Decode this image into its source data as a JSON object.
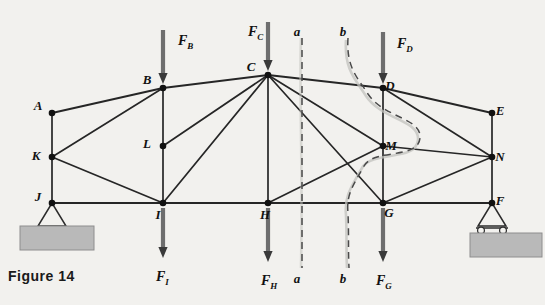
{
  "figure": {
    "caption": "Figure 14"
  },
  "nodes": [
    {
      "id": "A",
      "label": "A",
      "x": 52,
      "y": 113,
      "label_dx": -14,
      "label_dy": -3
    },
    {
      "id": "B",
      "label": "B",
      "x": 163,
      "y": 88,
      "label_dx": -16,
      "label_dy": -4
    },
    {
      "id": "C",
      "label": "C",
      "x": 268,
      "y": 75,
      "label_dx": -17,
      "label_dy": -4
    },
    {
      "id": "D",
      "label": "D",
      "x": 383,
      "y": 88,
      "label_dx": 7,
      "label_dy": 2
    },
    {
      "id": "E",
      "label": "E",
      "x": 492,
      "y": 113,
      "label_dx": 8,
      "label_dy": 2
    },
    {
      "id": "F",
      "label": "F",
      "x": 492,
      "y": 203,
      "label_dx": 8,
      "label_dy": 2
    },
    {
      "id": "G",
      "label": "G",
      "x": 383,
      "y": 203,
      "label_dx": 6,
      "label_dy": 14
    },
    {
      "id": "H",
      "label": "H",
      "x": 268,
      "y": 203,
      "label_dx": -3,
      "label_dy": 16
    },
    {
      "id": "I",
      "label": "I",
      "x": 163,
      "y": 203,
      "label_dx": -5,
      "label_dy": 16
    },
    {
      "id": "J",
      "label": "J",
      "x": 52,
      "y": 203,
      "label_dx": -14,
      "label_dy": -2
    },
    {
      "id": "K",
      "label": "K",
      "x": 52,
      "y": 157,
      "label_dx": -16,
      "label_dy": 3
    },
    {
      "id": "L",
      "label": "L",
      "x": 163,
      "y": 146,
      "label_dx": -16,
      "label_dy": 2
    },
    {
      "id": "M",
      "label": "M",
      "x": 383,
      "y": 146,
      "label_dx": 8,
      "label_dy": 4
    },
    {
      "id": "N",
      "label": "N",
      "x": 492,
      "y": 157,
      "label_dx": 8,
      "label_dy": 4
    }
  ],
  "members": [
    {
      "from": "A",
      "to": "B",
      "type": "chord"
    },
    {
      "from": "B",
      "to": "C",
      "type": "chord"
    },
    {
      "from": "C",
      "to": "D",
      "type": "chord"
    },
    {
      "from": "D",
      "to": "E",
      "type": "chord"
    },
    {
      "from": "J",
      "to": "I",
      "type": "chord"
    },
    {
      "from": "I",
      "to": "H",
      "type": "chord"
    },
    {
      "from": "H",
      "to": "G",
      "type": "chord"
    },
    {
      "from": "G",
      "to": "F",
      "type": "chord"
    },
    {
      "from": "A",
      "to": "K",
      "type": "member"
    },
    {
      "from": "K",
      "to": "J",
      "type": "member"
    },
    {
      "from": "B",
      "to": "L",
      "type": "member"
    },
    {
      "from": "L",
      "to": "I",
      "type": "member"
    },
    {
      "from": "C",
      "to": "H",
      "type": "member"
    },
    {
      "from": "D",
      "to": "M",
      "type": "member"
    },
    {
      "from": "M",
      "to": "G",
      "type": "member"
    },
    {
      "from": "E",
      "to": "N",
      "type": "member"
    },
    {
      "from": "N",
      "to": "F",
      "type": "member"
    },
    {
      "from": "K",
      "to": "B",
      "type": "member"
    },
    {
      "from": "K",
      "to": "I",
      "type": "member"
    },
    {
      "from": "B",
      "to": "L",
      "type": "member"
    },
    {
      "from": "L",
      "to": "C",
      "type": "member"
    },
    {
      "from": "C",
      "to": "L",
      "type": "member"
    },
    {
      "from": "I",
      "to": "C",
      "type": "member"
    },
    {
      "from": "C",
      "to": "M",
      "type": "member"
    },
    {
      "from": "C",
      "to": "G",
      "type": "member"
    },
    {
      "from": "H",
      "to": "M",
      "type": "member"
    },
    {
      "from": "D",
      "to": "N",
      "type": "member"
    },
    {
      "from": "M",
      "to": "N",
      "type": "member"
    },
    {
      "from": "G",
      "to": "N",
      "type": "member"
    }
  ],
  "forces": [
    {
      "id": "FB",
      "label": "F",
      "sub": "B",
      "node": "B",
      "x": 163,
      "y_tail": 30,
      "y_tip": 84,
      "label_x": 178,
      "label_y": 45,
      "direction": "down"
    },
    {
      "id": "FC",
      "label": "F",
      "sub": "C",
      "node": "C",
      "x": 268,
      "y_tail": 22,
      "y_tip": 71,
      "label_x": 248,
      "label_y": 36,
      "direction": "down"
    },
    {
      "id": "FD",
      "label": "F",
      "sub": "D",
      "node": "D",
      "x": 383,
      "y_tail": 32,
      "y_tip": 84,
      "label_x": 397,
      "label_y": 48,
      "direction": "down"
    },
    {
      "id": "FI",
      "label": "F",
      "sub": "I",
      "node": "I",
      "x": 163,
      "y_tail": 208,
      "y_tip": 258,
      "label_x": 156,
      "label_y": 281,
      "direction": "down"
    },
    {
      "id": "FH",
      "label": "F",
      "sub": "H",
      "node": "H",
      "x": 268,
      "y_tail": 208,
      "y_tip": 262,
      "label_x": 261,
      "label_y": 285,
      "direction": "down"
    },
    {
      "id": "FG",
      "label": "F",
      "sub": "G",
      "node": "G",
      "x": 383,
      "y_tail": 208,
      "y_tip": 262,
      "label_x": 376,
      "label_y": 285,
      "direction": "down"
    }
  ],
  "sections": [
    {
      "id": "a",
      "label": "a",
      "type": "straight",
      "x": 302,
      "y_top": 38,
      "y_bottom": 268,
      "top_label_x": 297,
      "top_label_y": 36,
      "bottom_label_x": 297,
      "bottom_label_y": 283
    },
    {
      "id": "b",
      "label": "b",
      "type": "curved",
      "x": 348,
      "y_top": 38,
      "y_bottom": 268,
      "top_label_x": 343,
      "top_label_y": 36,
      "bottom_label_x": 343,
      "bottom_label_y": 283
    }
  ],
  "supports": [
    {
      "id": "pin",
      "node": "J",
      "kind": "pin",
      "x": 52,
      "y": 203,
      "base_y": 226,
      "block_x": 20,
      "block_y": 226,
      "block_w": 74,
      "block_h": 24
    },
    {
      "id": "roller",
      "node": "F",
      "kind": "roller",
      "x": 492,
      "y": 203,
      "base_y": 226,
      "block_x": 470,
      "block_y": 232,
      "block_w": 72,
      "block_h": 24
    }
  ],
  "colors": {
    "background": "#f2f1ee",
    "member": "#262626",
    "arrow_shaft": "#6e6e6e",
    "arrow_head": "#3a3a3a",
    "section_dash": "#4a4a4a",
    "ground_fill": "#b9b9b9",
    "text": "#111111"
  }
}
